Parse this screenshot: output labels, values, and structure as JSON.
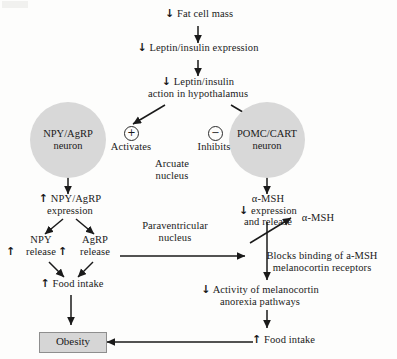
{
  "diagram": {
    "title_present": false,
    "background_color": "#fdfdfc",
    "ink_color": "#1a1a1a",
    "neuron_fill": "#d8d8d8",
    "obesity_fill": "#d6d6d6",
    "nodes": {
      "fat_cell_mass": {
        "arrow": "↓",
        "text": "Fat cell mass"
      },
      "leptin_expression": {
        "arrow": "↓",
        "text": "Leptin/insulin expression"
      },
      "leptin_action": {
        "arrow": "↓",
        "line1": "Leptin/insulin",
        "line2": "action in hypothalamus"
      },
      "npy_agrp_neuron": {
        "line1": "NPY/AgRP",
        "line2": "neuron"
      },
      "pomc_cart_neuron": {
        "line1": "POMC/CART",
        "line2": "neuron"
      },
      "activates": {
        "sign": "+",
        "text": "Activates"
      },
      "inhibits": {
        "sign": "−",
        "text": "Inhibits"
      },
      "arcuate_nucleus": {
        "line1": "Arcuate",
        "line2": "nucleus"
      },
      "npy_agrp_expression": {
        "arrow": "↑",
        "line1": "NPY/AgRP",
        "line2": "expression"
      },
      "npy_release": {
        "arrow": "↑",
        "line1": "NPY",
        "line2": "release"
      },
      "agrp_release": {
        "arrow": "↑",
        "line1": "AgRP",
        "line2": "release"
      },
      "food_intake_left": {
        "arrow": "↑",
        "text": "Food intake"
      },
      "paraventricular_nucleus": {
        "line1": "Paraventricular",
        "line2": "nucleus"
      },
      "obesity": {
        "text": "Obesity"
      },
      "amsh_expression": {
        "arrow": "↓",
        "line1": "α-MSH",
        "line2": "expression",
        "line3": "and release"
      },
      "amsh_standalone": {
        "text": "α-MSH"
      },
      "blocks_binding": {
        "line1": "Blocks binding of a-MSH",
        "line2": "melanocortin receptors"
      },
      "melanocortin_activity": {
        "arrow": "↓",
        "line1": "Activity of melanocortin",
        "line2": "anorexia pathways"
      },
      "food_intake_right": {
        "arrow": "↑",
        "text": "Food intake"
      }
    }
  }
}
